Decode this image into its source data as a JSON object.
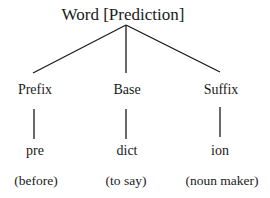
{
  "diagram": {
    "root": {
      "label": "Word [Prediction]"
    },
    "branches": [
      {
        "part": "Prefix",
        "morpheme": "pre",
        "meaning": "(before)"
      },
      {
        "part": "Base",
        "morpheme": "dict",
        "meaning": "(to say)"
      },
      {
        "part": "Suffix",
        "morpheme": "ion",
        "meaning": "(noun maker)"
      }
    ],
    "colors": {
      "line": "#1a1a1a",
      "text": "#1a1a1a",
      "background": "#ffffff"
    }
  }
}
